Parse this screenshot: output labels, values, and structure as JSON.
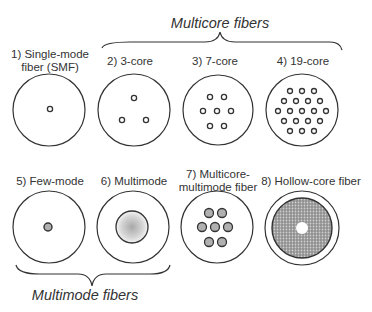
{
  "groups": {
    "multicore": "Multicore fibers",
    "multimode": "Multimode fibers"
  },
  "fibers": [
    {
      "label_line1": "1) Single-mode",
      "label_line2": "fiber (SMF)",
      "type": "single-core"
    },
    {
      "label_line1": "2) 3-core",
      "label_line2": "",
      "type": "multicore",
      "cores": 3
    },
    {
      "label_line1": "3) 7-core",
      "label_line2": "",
      "type": "multicore",
      "cores": 7
    },
    {
      "label_line1": "4) 19-core",
      "label_line2": "",
      "type": "multicore",
      "cores": 19
    },
    {
      "label_line1": "5) Few-mode",
      "label_line2": "",
      "type": "few-mode"
    },
    {
      "label_line1": "6) Multimode",
      "label_line2": "",
      "type": "multimode"
    },
    {
      "label_line1": "7) Multicore-",
      "label_line2": "multimode fiber",
      "type": "multicore-multimode",
      "cores": 7
    },
    {
      "label_line1": "8) Hollow-core fiber",
      "label_line2": "",
      "type": "hollow-core"
    }
  ],
  "colors": {
    "stroke": "#333333",
    "core_fill_gray": "#b0b0b0",
    "hollow_fill": "#9a9a9a"
  }
}
